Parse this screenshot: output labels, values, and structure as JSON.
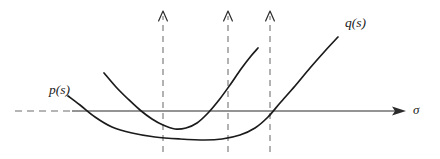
{
  "figure": {
    "kind": "math-plot-diagram",
    "background_color": "#ffffff",
    "curve_color": "#1b1b1b",
    "axis_color": "#2b2b2b",
    "dash_color": "#7a7a7a",
    "labels": {
      "p_curve": "p(s)",
      "q_curve": "q(s)",
      "axis": "σ"
    }
  },
  "chart_data": {
    "type": "line",
    "title": "",
    "xlabel": "σ",
    "ylabel": "",
    "grid": false,
    "legend": "inline-labels",
    "axis": {
      "name": "σ",
      "y_pixel": 111,
      "solid_from_x": 72,
      "solid_to_x": 405,
      "dashed_from_x": 15,
      "dashed_to_x": 72,
      "arrow_tip_x": 406,
      "arrow_label": "σ"
    },
    "vertical_dashed_arrows": [
      {
        "x": 163,
        "tip_y": 11,
        "base_y": 152
      },
      {
        "x": 228,
        "tip_y": 11,
        "base_y": 152
      },
      {
        "x": 270,
        "tip_y": 11,
        "base_y": 152
      }
    ],
    "series": [
      {
        "name": "p(s)",
        "label": "p(s)",
        "label_position": {
          "x": 49,
          "y": 83
        },
        "description": "shallow wide upward parabola, crosses axis near x=83 descending and near x=272 ascending, minimum near x=215",
        "points": [
          [
            68,
            96
          ],
          [
            80,
            105
          ],
          [
            95,
            117
          ],
          [
            112,
            127
          ],
          [
            132,
            133
          ],
          [
            155,
            137
          ],
          [
            180,
            139
          ],
          [
            205,
            140
          ],
          [
            222,
            139
          ],
          [
            240,
            135
          ],
          [
            255,
            128
          ],
          [
            268,
            117
          ],
          [
            280,
            103
          ],
          [
            295,
            86
          ],
          [
            310,
            68
          ],
          [
            325,
            51
          ],
          [
            338,
            37
          ]
        ]
      },
      {
        "name": "q(s)",
        "label": "q(s)",
        "label_position": {
          "x": 345,
          "y": 16
        },
        "description": "steeper narrow upward parabola starting upper-left, minimum near x=170, rising to upper right",
        "points": [
          [
            104,
            73
          ],
          [
            116,
            87
          ],
          [
            128,
            99
          ],
          [
            140,
            110
          ],
          [
            152,
            119
          ],
          [
            163,
            125
          ],
          [
            175,
            129
          ],
          [
            186,
            128
          ],
          [
            197,
            123
          ],
          [
            208,
            113
          ],
          [
            219,
            100
          ],
          [
            230,
            85
          ],
          [
            241,
            69
          ],
          [
            251,
            56
          ],
          [
            258,
            48
          ]
        ]
      }
    ]
  }
}
